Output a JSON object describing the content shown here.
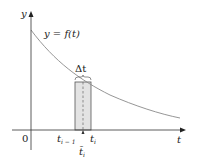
{
  "figure": {
    "curve_label": "y = f(t)",
    "y_axis_label": "y",
    "x_axis_label": "t",
    "origin_label": "0",
    "delta_label": "Δt",
    "left_endpoint_label": "t",
    "left_endpoint_sub": "i − 1",
    "right_endpoint_label": "t",
    "right_endpoint_sub": "i",
    "sample_point_label": "t̄",
    "sample_point_sub": "i",
    "colors": {
      "axis": "#333333",
      "curve": "#8a8a8a",
      "rect_fill": "#e3e3e3",
      "rect_stroke": "#555555"
    }
  }
}
